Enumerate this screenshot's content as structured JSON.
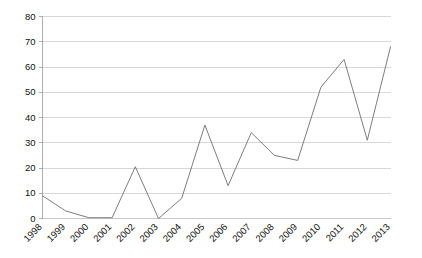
{
  "chart_data": {
    "type": "line",
    "title": "",
    "subtitle": "",
    "xlabel": "",
    "ylabel": "",
    "categories": [
      "1998",
      "1999",
      "2000",
      "2001",
      "2002",
      "2003",
      "2004",
      "2005",
      "2006",
      "2007",
      "2008",
      "2009",
      "2010",
      "2011",
      "2012",
      "2013"
    ],
    "series": [
      {
        "name": "",
        "values": [
          9,
          3,
          0.3,
          0.3,
          20.5,
          0,
          8,
          37,
          13,
          34,
          25,
          23,
          52,
          63,
          31,
          68
        ]
      }
    ],
    "ylim": [
      0,
      80
    ],
    "yticks": [
      0,
      10,
      20,
      30,
      40,
      50,
      60,
      70,
      80
    ],
    "ytick_labels": [
      "0",
      "10",
      "20",
      "30",
      "40",
      "50",
      "60",
      "70",
      "80"
    ],
    "xtick_labels": [
      "1998",
      "1999",
      "2000",
      "2001",
      "2002",
      "2003",
      "2004",
      "2005",
      "2006",
      "2007",
      "2008",
      "2009",
      "2010",
      "2011",
      "2012",
      "2013"
    ],
    "grid": true,
    "grid_axis": "y",
    "legend": false,
    "legend_position": "none",
    "annotations": [],
    "colors": {
      "line": "#6e6e6e",
      "grid": "#c8c8c8",
      "axis": "#9a9a9a",
      "text": "#111111",
      "background": "#ffffff"
    },
    "xtick_label_rotation": 45
  },
  "figure": {
    "background_color": "#ffffff"
  }
}
